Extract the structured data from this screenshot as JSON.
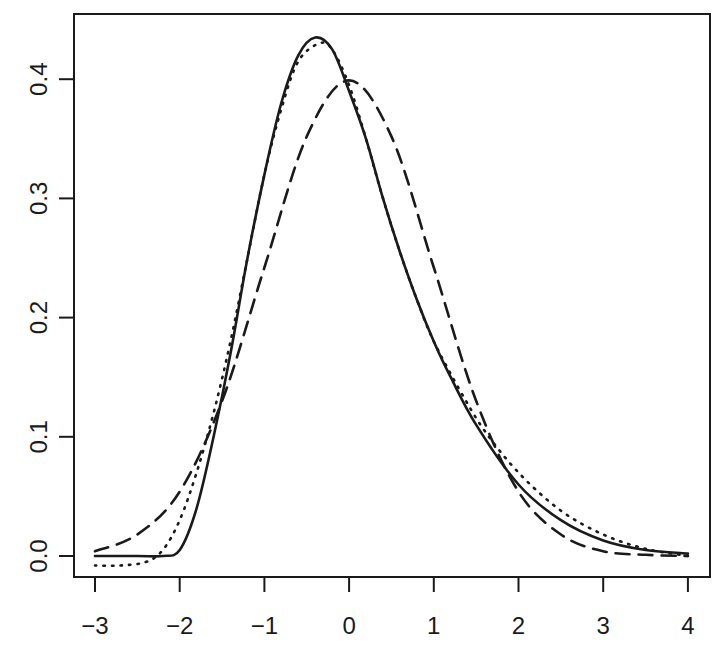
{
  "chart_data": {
    "type": "line",
    "title": "",
    "xlabel": "",
    "ylabel": "",
    "xlim": [
      -3,
      4
    ],
    "ylim": [
      0,
      0.44
    ],
    "grid": false,
    "legend": null,
    "x_ticks": [
      "-3",
      "-2",
      "-1",
      "0",
      "1",
      "2",
      "3",
      "4"
    ],
    "y_ticks": [
      "0.0",
      "0.1",
      "0.2",
      "0.3",
      "0.4"
    ],
    "colors": {
      "axis": "#1a1a1a",
      "line": "#1a1a1a",
      "background": "#ffffff"
    },
    "series": [
      {
        "name": "solid",
        "style": "solid",
        "x": [
          -3.0,
          -2.5,
          -2.2,
          -2.0,
          -1.8,
          -1.6,
          -1.4,
          -1.2,
          -1.0,
          -0.8,
          -0.6,
          -0.4,
          -0.2,
          0.0,
          0.2,
          0.4,
          0.6,
          0.8,
          1.0,
          1.2,
          1.5,
          2.0,
          2.5,
          3.0,
          3.5,
          4.0
        ],
        "values": [
          0.0,
          0.0,
          0.0,
          0.005,
          0.04,
          0.1,
          0.17,
          0.25,
          0.32,
          0.38,
          0.42,
          0.435,
          0.425,
          0.39,
          0.35,
          0.3,
          0.255,
          0.215,
          0.18,
          0.15,
          0.11,
          0.06,
          0.03,
          0.013,
          0.005,
          0.002
        ]
      },
      {
        "name": "dotted",
        "style": "dotted",
        "x": [
          -3.0,
          -2.7,
          -2.4,
          -2.2,
          -2.0,
          -1.8,
          -1.6,
          -1.4,
          -1.2,
          -1.0,
          -0.8,
          -0.6,
          -0.35,
          -0.2,
          0.0,
          0.2,
          0.4,
          0.6,
          0.8,
          1.0,
          1.3,
          1.6,
          2.0,
          2.5,
          3.0,
          3.5,
          4.0
        ],
        "values": [
          -0.008,
          -0.008,
          -0.005,
          0.005,
          0.03,
          0.07,
          0.12,
          0.18,
          0.25,
          0.32,
          0.375,
          0.415,
          0.43,
          0.425,
          0.395,
          0.35,
          0.3,
          0.255,
          0.215,
          0.18,
          0.14,
          0.105,
          0.07,
          0.038,
          0.018,
          0.006,
          0.0
        ]
      },
      {
        "name": "dashed",
        "style": "dashed",
        "x": [
          -3.0,
          -2.5,
          -2.0,
          -1.5,
          -1.0,
          -0.5,
          0.0,
          0.5,
          1.0,
          1.5,
          2.0,
          2.5,
          3.0,
          3.5,
          4.0
        ],
        "values": [
          0.004,
          0.018,
          0.054,
          0.13,
          0.242,
          0.352,
          0.399,
          0.352,
          0.242,
          0.13,
          0.054,
          0.018,
          0.004,
          0.001,
          0.0
        ]
      }
    ]
  }
}
